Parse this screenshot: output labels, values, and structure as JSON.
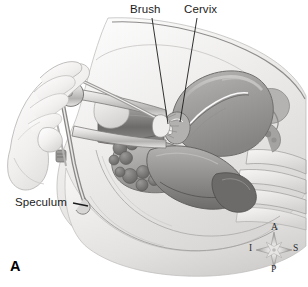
{
  "figure": {
    "panel_letter": "A",
    "background_color": "#ffffff",
    "label_color": "#1b1b1b"
  },
  "labels": [
    {
      "id": "brush",
      "text": "Brush",
      "leader": "line"
    },
    {
      "id": "cervix",
      "text": "Cervix",
      "leader": "line"
    },
    {
      "id": "speculum",
      "text": "Speculum",
      "leader": "dash"
    }
  ],
  "compass": {
    "name": "anatomical-orientation-rose",
    "north": "A",
    "south": "P",
    "west": "I",
    "east": "S"
  },
  "anatomy": {
    "palette": {
      "body_light": "#edebea",
      "tissue_mid": "#c9c7c6",
      "organ_gray": "#a6a4a3",
      "organ_dark": "#7c7a79",
      "outline": "#6f6d6c",
      "highlight": "#fbfafa",
      "instrument": "#d8d6d5"
    },
    "structures": [
      "abdominal-wall",
      "uterus",
      "endometrial-cavity",
      "cervix",
      "vagina",
      "bladder",
      "rectum",
      "bowel-loops",
      "sacrum",
      "ovary",
      "fallopian-tube",
      "pubic-symphysis",
      "examiner-hand",
      "speculum",
      "cervical-brush"
    ]
  }
}
